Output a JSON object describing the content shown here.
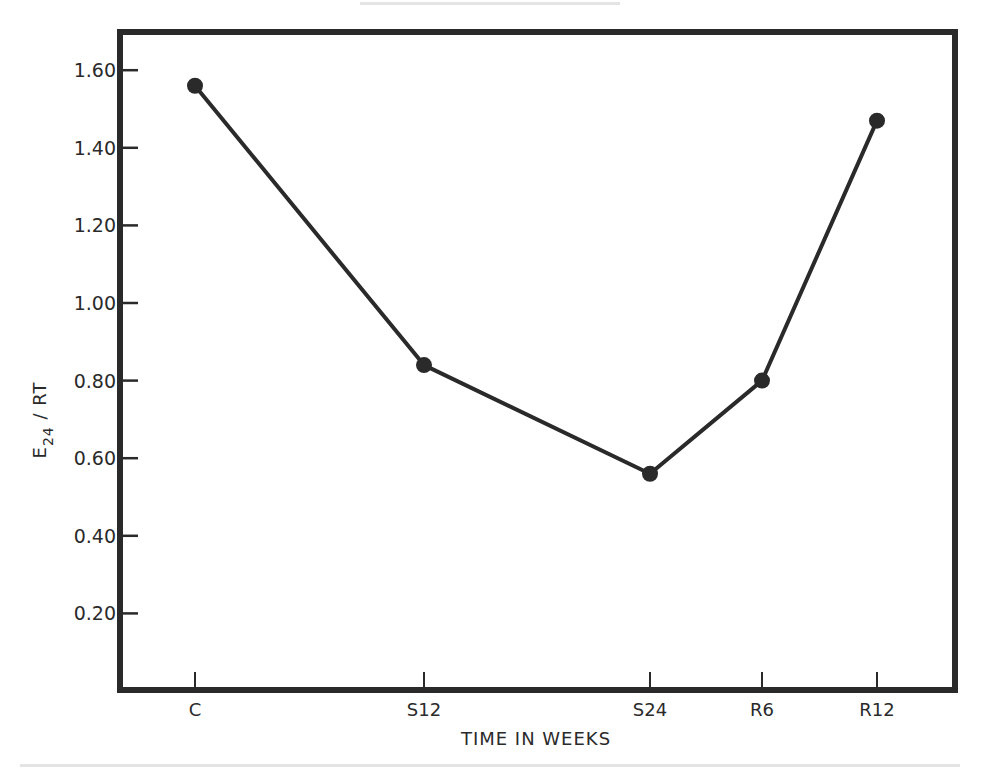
{
  "chart_data": {
    "type": "line",
    "title": "",
    "xlabel": "TIME IN WEEKS",
    "ylabel": "E24 / RT",
    "ylabel_main": "E",
    "ylabel_sub": "24",
    "ylabel_rest": " / RT",
    "categories": [
      "C",
      "S12",
      "S24",
      "R6",
      "R12"
    ],
    "x_positions": [
      195,
      424,
      650,
      762,
      877
    ],
    "series": [
      {
        "name": "E24/RT",
        "values": [
          1.56,
          0.84,
          0.56,
          0.8,
          1.47
        ]
      }
    ],
    "ylim": [
      0,
      1.7
    ],
    "yticks": [
      0.2,
      0.4,
      0.6,
      0.8,
      1.0,
      1.2,
      1.4,
      1.6
    ],
    "ytick_labels": [
      "0.20",
      "0.40",
      "0.60",
      "0.80",
      "1.00",
      "1.20",
      "1.40",
      "1.60"
    ],
    "grid": false,
    "legend": null,
    "colors": {
      "line": "#2a2a2a",
      "marker": "#2a2a2a",
      "frame": "#2a2a2a",
      "background": "#ffffff"
    }
  }
}
